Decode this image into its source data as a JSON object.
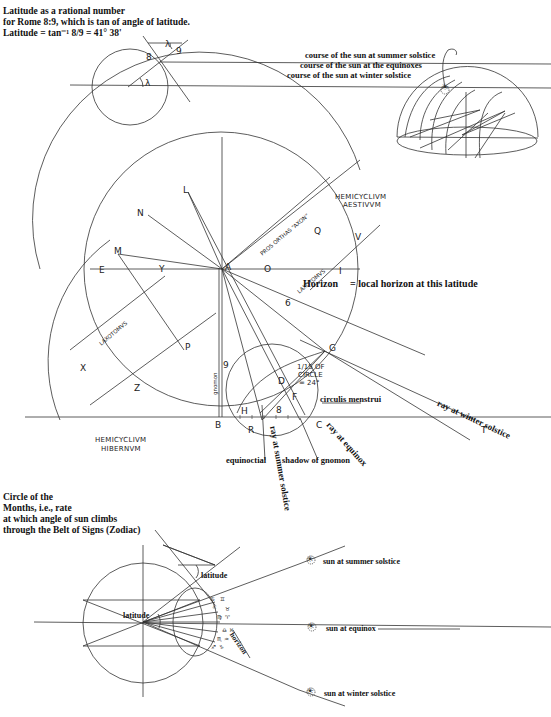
{
  "top_left": {
    "caption_lines": [
      "Latitude as a rational number",
      "for Rome 8:9, which is tan of angle of latitude.",
      "Latitude = tan⁻¹ 8/9 = 41° 38'"
    ],
    "labels": {
      "lambda_top": "λ",
      "lambda_center": "λ",
      "eight": "8",
      "nine": "9"
    }
  },
  "top_right": {
    "legend": [
      "course of the sun at summer solstice",
      "course of the sun at the equinoxes",
      "course of the sun at winter solstice"
    ]
  },
  "main_diagram": {
    "points": {
      "L": "L",
      "N": "N",
      "M": "M",
      "E": "E",
      "Y": "Y",
      "X": "X",
      "Z": "Z",
      "P": "P",
      "A": "A",
      "O": "O",
      "Q": "Q",
      "V": "V",
      "I": "I",
      "G": "G",
      "D": "D",
      "F": "F",
      "H": "H",
      "B": "B",
      "R": "R",
      "C": "C",
      "T": "T"
    },
    "numbers": {
      "six": "6",
      "nine": "9",
      "eight": "8"
    },
    "hemicyclium_aestivum": [
      "HEMICYCLIVM",
      "AESTIVVM"
    ],
    "hemicyclium_hibernum": [
      "HEMICYCLIVM",
      "HIBERNVM"
    ],
    "line_labels": {
      "pros_orthas": "PROS ORTHAS “AXON”",
      "laxotomus_upper": "LAXOTOMVS",
      "laxotomus_lower": "LAXOTOMVS",
      "gnomon": "gnomon",
      "fifteenth_circle": [
        "1/15 OF",
        "CIRCLE",
        "= 24°"
      ],
      "circulus_menstrui": "circulis menstrui",
      "horizon": "Horizon",
      "horizon_note": "= local horizon at this latitude",
      "ray_winter": "ray at winter solstice",
      "ray_equinox": "ray at equinox",
      "ray_summer": "ray at summer solstice",
      "equinoctial": "equinoctial",
      "shadow": "shadow of gnomon"
    }
  },
  "bottom": {
    "caption_lines": [
      "Circle of the",
      "Months, i.e., rate",
      "at which angle of sun climbs",
      "through the Belt of Signs (Zodiac)"
    ],
    "labels": {
      "latitude_top": "latitude",
      "latitude_center": "latitude",
      "horizon": "horizon",
      "sun_summer": "sun at summer solstice",
      "sun_equinox": "sun at equinox",
      "sun_winter": "sun at winter solstice"
    },
    "zodiac_signs": [
      "♋",
      "♊",
      "♌",
      "♉",
      "♍",
      "♈",
      "♎",
      "♓",
      "♏",
      "♒",
      "♐",
      "♑"
    ]
  },
  "colors": {
    "ink": "#111111",
    "paper": "#ffffff",
    "line": "#333333"
  }
}
